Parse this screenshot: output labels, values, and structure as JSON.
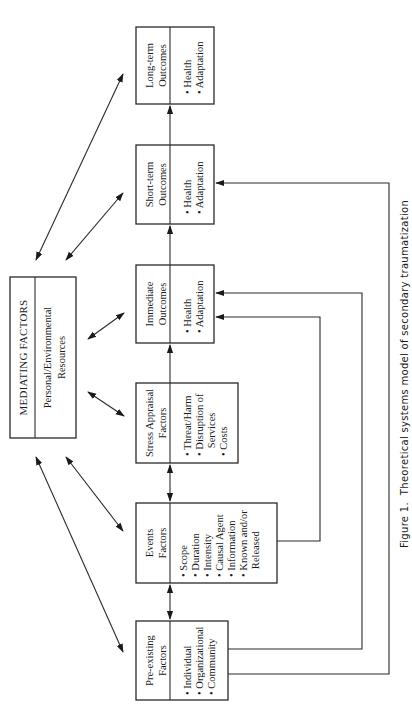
{
  "figure": {
    "caption": "Figure 1.  Theoretical systems model of secondary traumatization",
    "orientation": "rotated 90° counter-clockwise"
  },
  "mediating": {
    "title": "MEDIATING FACTORS",
    "subtitle_line1": "Personal/Environmental",
    "subtitle_line2": "Resources"
  },
  "boxes": {
    "long_term": {
      "title1": "Long-term",
      "title2": "Outcomes",
      "items": [
        "• Health",
        "• Adaptation"
      ]
    },
    "short_term": {
      "title1": "Short-term",
      "title2": "Outcomes",
      "items": [
        "• Health",
        "• Adaptation"
      ]
    },
    "immediate": {
      "title1": "Immediate",
      "title2": "Outcomes",
      "items": [
        "• Health",
        "• Adaptation"
      ]
    },
    "stress": {
      "title1": "Stress Appraisal",
      "title2": "Factors",
      "items": [
        "• Threat/Harm",
        "• Disruption of",
        "   Services",
        "• Costs"
      ]
    },
    "events": {
      "title1": "Events",
      "title2": "Factors",
      "items": [
        "• Scope",
        "• Duration",
        "• Intensity",
        "• Causal Agent",
        "• Information",
        "• Known and/or",
        "   Released"
      ]
    },
    "preexisting": {
      "title1": "Pre-existing",
      "title2": "Factors",
      "items": [
        "• Individual",
        "• Organizational",
        "• Community"
      ]
    }
  },
  "colors": {
    "line": "#2a2a2a",
    "background": "#ffffff"
  }
}
